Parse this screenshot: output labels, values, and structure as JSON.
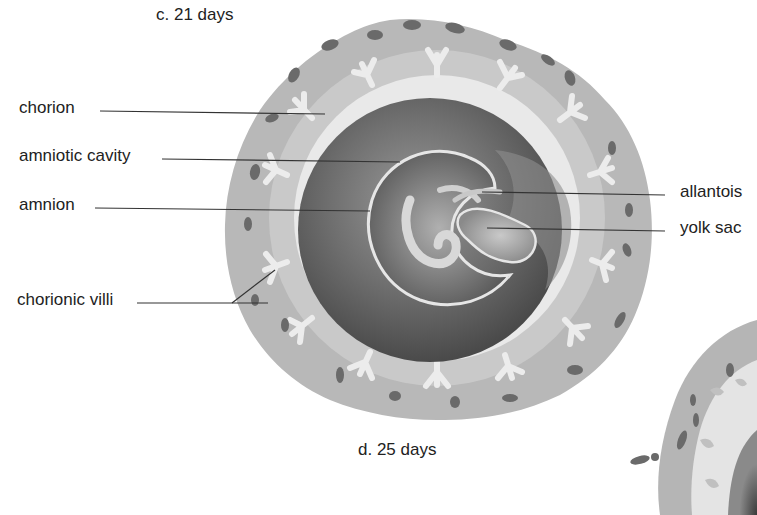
{
  "figure": {
    "panel_c": {
      "caption": "c.  21 days",
      "labels": {
        "chorion": "chorion",
        "amniotic_cavity": "amniotic cavity",
        "amnion": "amnion",
        "allantois": "allantois",
        "yolk_sac": "yolk sac",
        "chorionic_villi": "chorionic villi"
      }
    },
    "panel_d": {
      "caption": "d.  25 days"
    }
  },
  "colors": {
    "background": "#ffffff",
    "outer_disc": "#b8b8b8",
    "villi_light": "#e6e6e6",
    "chorionic_cavity": "#e9e9e9",
    "amniotic_dark": "#6e6e6e",
    "blood_spots": "#6a6a6a",
    "leader_line": "#333333"
  }
}
